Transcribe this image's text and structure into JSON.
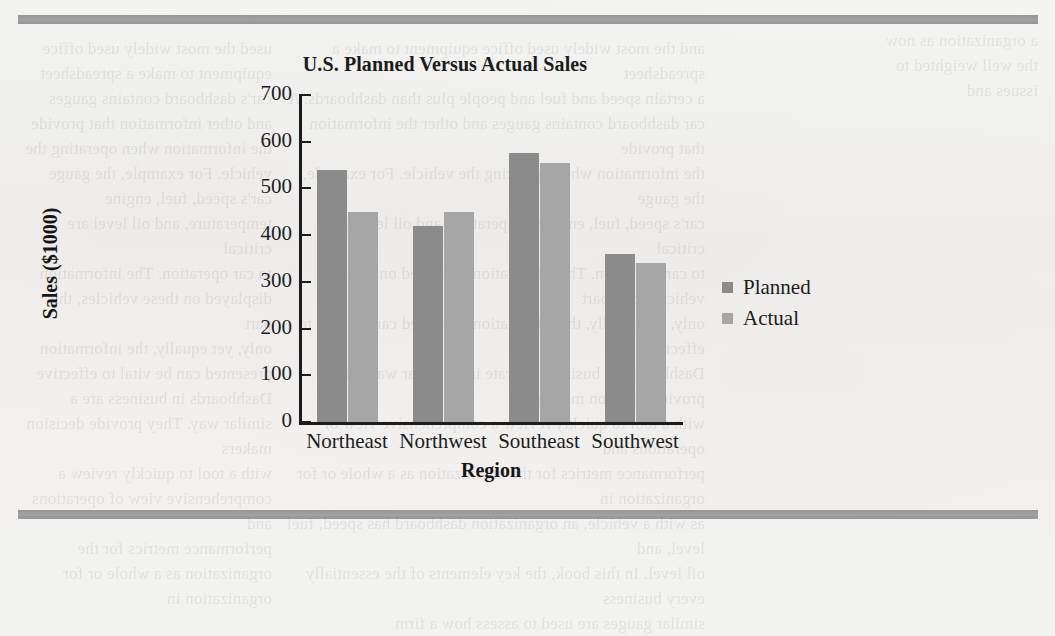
{
  "page": {
    "bleed_left": "used the most widely used office equipment to make a spreadsheet\ncar's dashboard contains gauges and other information that provide\nthe information when operating the vehicle. For example, the gauge\ncar's speed, fuel, engine temperature, and oil level are critical\nto car operation. The information displayed on these vehicles, this part\nonly, yet equally, the information presented can be vital to effective\nDashboards in business are a similar way. They provide decision makers\nwith a tool to quickly review a comprehensive view of operations and\nperformance metrics for the organization as a whole or for organization in",
    "bleed_mid": "and the most widely used office equipment to make a spreadsheet\na certain speed and fuel and people plus than dashboards. A\ncar dashboard contains gauges and other the information that provide\nthe information when operating the vehicle. For example, the gauge\ncar's speed, fuel, engine temperature, and oil level are critical\nto car operation. The information displayed on these vehicles, this part\nonly, yet equally, the information presented can be vital to effective\nDashboards in business operate in a similar way. They provide decision making\nwith a tool to quickly review a comprehensive view of operations and\nperformance metrics for the organization as a whole or for organization in\nas with a vehicle, an organization dashboard has speed, fuel level, and\noil level. In this book, the key elements of the essentially every business\nsimilar gauges are used to assess how a firm",
    "bleed_right": "a organization as now\nthe well weighted to\nissues and"
  },
  "chart_data": {
    "type": "bar",
    "title": "U.S. Planned Versus Actual Sales",
    "xlabel": "Region",
    "ylabel": "Sales ($1000)",
    "categories": [
      "Northeast",
      "Northwest",
      "Southeast",
      "Southwest"
    ],
    "series": [
      {
        "name": "Planned",
        "color": "#8b8b8b",
        "values": [
          540,
          420,
          575,
          360
        ]
      },
      {
        "name": "Actual",
        "color": "#a6a6a6",
        "values": [
          450,
          450,
          555,
          340
        ]
      }
    ],
    "ylim": [
      0,
      700
    ],
    "yticks": [
      0,
      100,
      200,
      300,
      400,
      500,
      600,
      700
    ],
    "grid": false,
    "legend_position": "right"
  }
}
